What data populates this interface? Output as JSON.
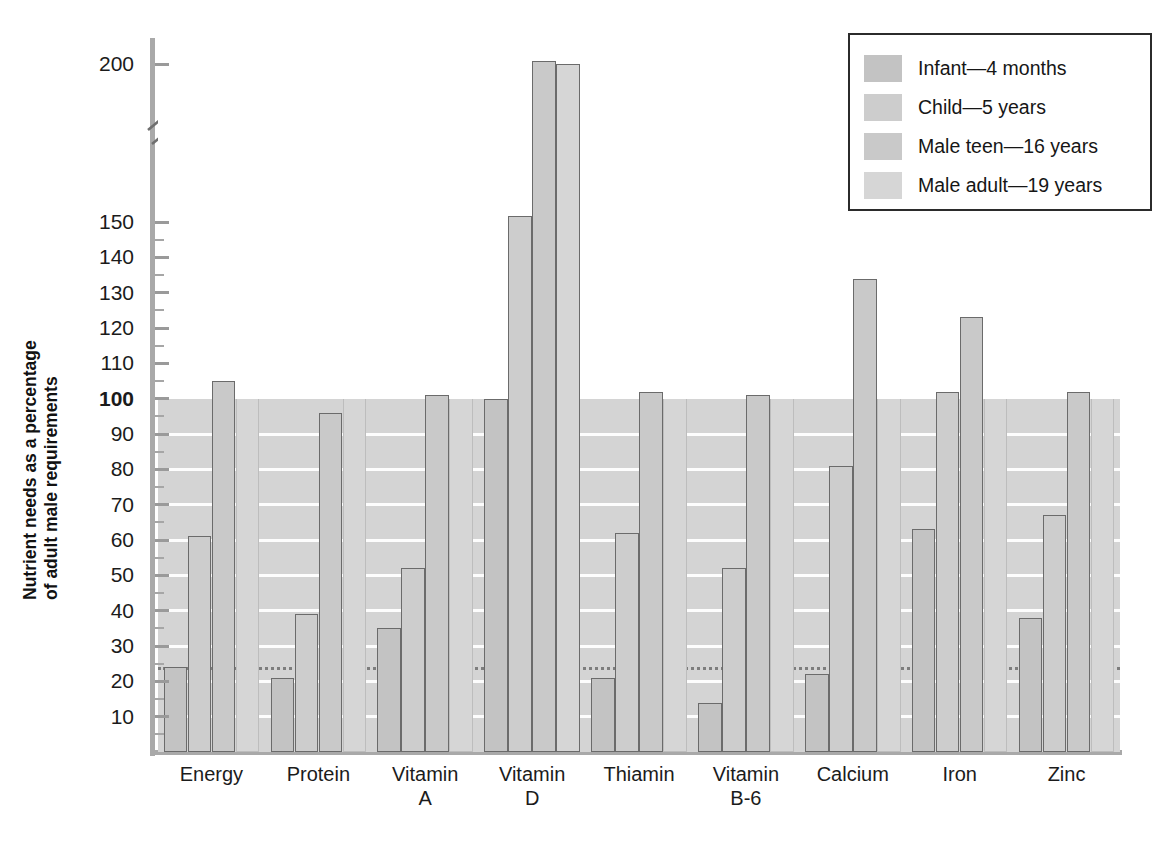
{
  "chart_data": {
    "type": "bar",
    "title": "",
    "xlabel": "",
    "ylabel": "Nutrient needs as a percentage of adult male requirements",
    "ylabel_line1": "Nutrient needs as a percentage",
    "ylabel_line2": "of adult male requirements",
    "categories": [
      "Energy",
      "Protein",
      "Vitamin A",
      "Vitamin D",
      "Thiamin",
      "Vitamin B-6",
      "Calcium",
      "Iron",
      "Zinc"
    ],
    "category_lines": [
      [
        "Energy",
        ""
      ],
      [
        "Protein",
        ""
      ],
      [
        "Vitamin",
        "A"
      ],
      [
        "Vitamin",
        "D"
      ],
      [
        "Thiamin",
        ""
      ],
      [
        "Vitamin",
        "B-6"
      ],
      [
        "Calcium",
        ""
      ],
      [
        "Iron",
        ""
      ],
      [
        "Zinc",
        ""
      ]
    ],
    "series": [
      {
        "name": "Infant—4 months",
        "color": "#c3c3c3",
        "values": [
          24,
          21,
          35,
          100,
          21,
          14,
          22,
          63,
          38
        ]
      },
      {
        "name": "Child—5 years",
        "color": "#cdcdcd",
        "values": [
          61,
          39,
          52,
          152,
          62,
          52,
          81,
          102,
          67
        ]
      },
      {
        "name": "Male teen—16 years",
        "color": "#c9c9c9",
        "values": [
          105,
          96,
          101,
          201,
          102,
          101,
          134,
          123,
          102
        ]
      },
      {
        "name": "Male adult—19 years",
        "color": "#d6d6d6",
        "values": [
          100,
          100,
          100,
          200,
          100,
          100,
          100,
          100,
          100
        ]
      }
    ],
    "ylim": [
      0,
      200
    ],
    "yticks_labeled": [
      10,
      20,
      30,
      40,
      50,
      60,
      70,
      80,
      90,
      100,
      110,
      120,
      130,
      140,
      150,
      200
    ],
    "y_bold_tick": 100,
    "axis_break_between": [
      150,
      200
    ],
    "grid": "horizontal-white-below-100",
    "reference_line": {
      "value": 24,
      "style": "dotted"
    },
    "legend_position": "top-right"
  },
  "legend": {
    "items": [
      {
        "label": "Infant—4 months",
        "swatch": "#c3c3c3"
      },
      {
        "label": "Child—5 years",
        "swatch": "#cdcdcd"
      },
      {
        "label": "Male teen—16 years",
        "swatch": "#c9c9c9"
      },
      {
        "label": "Male adult—19 years",
        "swatch": "#d6d6d6"
      }
    ]
  },
  "caption": ""
}
